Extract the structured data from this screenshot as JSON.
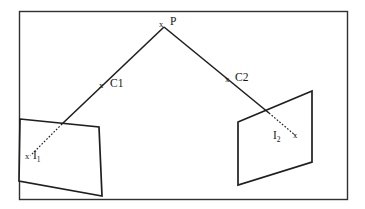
{
  "figure": {
    "background_color": "#ffffff",
    "stroke_color": "#262626",
    "text_color": "#161616",
    "frame": {
      "name": "outer-border",
      "x": 19,
      "y": 11,
      "width": 329,
      "height": 189
    },
    "points": {
      "P": {
        "label": "P",
        "marker": "x",
        "x": 164,
        "y": 26,
        "label_x": 171,
        "label_y": 18
      },
      "C1": {
        "label": "C1",
        "marker": "x",
        "x": 103,
        "y": 87,
        "label_x": 111,
        "label_y": 80
      },
      "C2": {
        "label": "C2",
        "marker": "x",
        "x": 229,
        "y": 81,
        "label_x": 236,
        "label_y": 74
      },
      "I1": {
        "label": "I",
        "subscript": "1",
        "marker": "x",
        "x": 28,
        "y": 158,
        "label_x": 34,
        "label_y": 152
      },
      "I2": {
        "label": "I",
        "subscript": "2",
        "marker": "x",
        "x": 297,
        "y": 138,
        "label_x": 274,
        "label_y": 133
      }
    },
    "image_plane_left": {
      "name": "image-plane-1",
      "points": "20,119 99,127 102,196 19,181"
    },
    "image_plane_right": {
      "name": "image-plane-2",
      "points": "238,122 312,91 312,162 238,185"
    },
    "ray_left_solid": {
      "name": "ray-P-to-plane1",
      "x1": 164,
      "y1": 27,
      "x2": 62,
      "y2": 124
    },
    "ray_right_solid": {
      "name": "ray-P-to-plane2",
      "x1": 164,
      "y1": 27,
      "x2": 269,
      "y2": 113
    },
    "ray_left_dashed": {
      "name": "ray-plane1-to-I1",
      "x1": 62,
      "y1": 124,
      "x2": 30,
      "y2": 156
    },
    "ray_right_dashed": {
      "name": "ray-plane2-to-I2",
      "x1": 269,
      "y1": 113,
      "x2": 296,
      "y2": 136
    }
  }
}
